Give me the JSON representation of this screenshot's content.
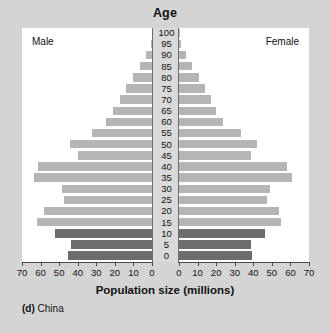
{
  "chart_data": {
    "type": "bar",
    "subtype": "population-pyramid",
    "title": "Age",
    "xlabel": "Population size (millions)",
    "ylabel": "Age",
    "caption_prefix": "(d)",
    "caption_text": "China",
    "left_panel_label": "Male",
    "right_panel_label": "Female",
    "categories": [
      "0",
      "5",
      "10",
      "15",
      "20",
      "25",
      "30",
      "35",
      "40",
      "45",
      "50",
      "55",
      "60",
      "65",
      "70",
      "75",
      "80",
      "85",
      "90",
      "95",
      "100"
    ],
    "age_tick_labels": [
      "100",
      "95",
      "90",
      "85",
      "80",
      "75",
      "70",
      "65",
      "60",
      "55",
      "50",
      "45",
      "40",
      "35",
      "30",
      "25",
      "20",
      "15",
      "10",
      "5",
      "0"
    ],
    "x_tick_labels_left": [
      "70",
      "60",
      "50",
      "40",
      "30",
      "20",
      "10",
      "0"
    ],
    "x_tick_labels_right": [
      "0",
      "10",
      "20",
      "30",
      "40",
      "50",
      "60",
      "70"
    ],
    "x_tick_values": [
      0,
      10,
      20,
      30,
      40,
      50,
      60,
      70
    ],
    "xlim": [
      0,
      70
    ],
    "grid": false,
    "legend_position": "none",
    "series": [
      {
        "name": "Male",
        "side": "left",
        "values": [
          45.0,
          43.5,
          52.5,
          62.0,
          58.0,
          47.5,
          48.5,
          63.5,
          61.5,
          40.0,
          44.0,
          32.5,
          25.0,
          21.0,
          17.5,
          14.0,
          10.0,
          6.5,
          3.0,
          0.8,
          0.2
        ]
      },
      {
        "name": "Female",
        "side": "right",
        "values": [
          39.5,
          38.5,
          46.5,
          55.0,
          54.0,
          47.5,
          49.0,
          61.0,
          58.0,
          38.5,
          42.0,
          33.5,
          23.5,
          20.0,
          17.0,
          14.0,
          10.5,
          7.0,
          3.5,
          1.0,
          0.3
        ]
      }
    ],
    "colors": {
      "bar_light": "#b5b5b5",
      "bar_dark": "#6d6d6d",
      "figure_background": "#d4d4d4",
      "panel_background": "#ffffff",
      "axis": "#4a4a4a",
      "text": "#111111"
    },
    "dark_categories": [
      "0",
      "5",
      "10"
    ]
  }
}
